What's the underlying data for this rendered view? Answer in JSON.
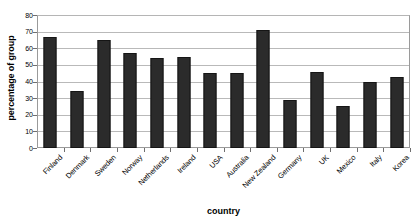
{
  "chart_data": {
    "type": "bar",
    "title": "",
    "xlabel": "country",
    "ylabel": "percentage of group",
    "categories": [
      "Finland",
      "Denmark",
      "Sweden",
      "Norway",
      "Netherlands",
      "Ireland",
      "USA",
      "Australia",
      "New Zealand",
      "Germany",
      "UK",
      "Mexico",
      "Italy",
      "Korea"
    ],
    "values": [
      67,
      34,
      65,
      57,
      54,
      55,
      45,
      45,
      71,
      29,
      46,
      25,
      40,
      43
    ],
    "ylim": [
      0,
      80
    ],
    "ytick_values": [
      0,
      10,
      20,
      30,
      40,
      50,
      60,
      70,
      80
    ],
    "ytick_labels": [
      "0",
      "10",
      "20",
      "30",
      "40",
      "50",
      "60",
      "70",
      "80"
    ],
    "grid": true,
    "legend": "none",
    "bar_color": "#2b2b2b",
    "gridline_color": "#b9b9b9",
    "axis_color": "#6f6f6f",
    "background_color": "#ffffff"
  }
}
